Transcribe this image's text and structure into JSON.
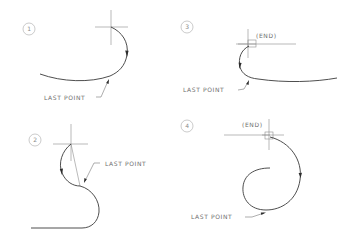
{
  "diagram": {
    "panels": [
      {
        "id": "panel-1",
        "number": "1",
        "last_point_label": "LAST POINT"
      },
      {
        "id": "panel-2",
        "number": "2",
        "last_point_label": "LAST POINT"
      },
      {
        "id": "panel-3",
        "number": "3",
        "last_point_label": "LAST POINT",
        "snap_label": "(END)"
      },
      {
        "id": "panel-4",
        "number": "4",
        "last_point_label": "LAST POINT",
        "snap_label": "(END)"
      }
    ]
  },
  "colors": {
    "background": "#ffffff",
    "curve": "#3a3a3a",
    "reference_line": "#8c8c8c",
    "text": "#6e6e6e"
  }
}
